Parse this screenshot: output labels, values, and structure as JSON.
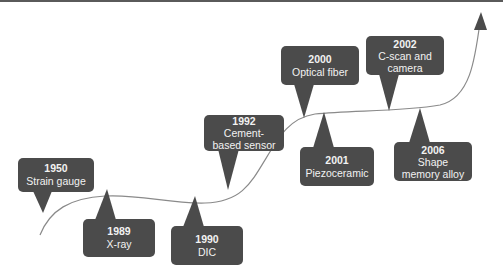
{
  "diagram": {
    "type": "timeline",
    "colors": {
      "callout_fill": "#4b4b4b",
      "callout_text": "#f2f2f2",
      "curve": "#8a8a8a",
      "arrowhead": "#4b4b4b",
      "background": "#ffffff",
      "top_border": "#5a5a5a"
    },
    "events": [
      {
        "year": "1950",
        "label": "Strain gauge",
        "position": "above"
      },
      {
        "year": "1989",
        "label": "X-ray",
        "position": "below"
      },
      {
        "year": "1990",
        "label": "DIC",
        "position": "below"
      },
      {
        "year": "1992",
        "label": "Cement-based sensor",
        "position": "above"
      },
      {
        "year": "2000",
        "label": "Optical fiber",
        "position": "above"
      },
      {
        "year": "2001",
        "label": "Piezoceramic",
        "position": "below"
      },
      {
        "year": "2002",
        "label": "C-scan and camera",
        "position": "above"
      },
      {
        "year": "2006",
        "label": "Shape memory alloy",
        "position": "below"
      }
    ]
  }
}
